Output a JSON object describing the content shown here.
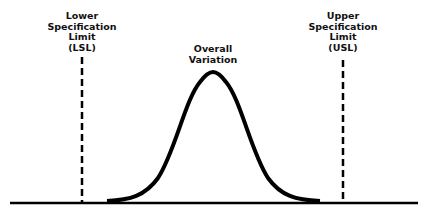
{
  "diagram": {
    "type": "process-capability",
    "colors": {
      "line": "#000000",
      "background": "#ffffff",
      "text": "#111111"
    },
    "labels": {
      "lsl": [
        "Lower",
        "Specification",
        "Limit",
        "(LSL)"
      ],
      "usl": [
        "Upper",
        "Specification",
        "Limit",
        "(USL)"
      ],
      "variation": [
        "Overall",
        "Variation"
      ]
    }
  }
}
